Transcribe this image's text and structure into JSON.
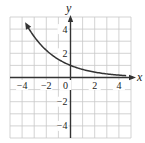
{
  "chart_data": {
    "type": "line",
    "title": "",
    "xlabel": "x",
    "ylabel": "y",
    "xlim": [
      -5,
      5
    ],
    "ylim": [
      -5,
      5
    ],
    "grid": true,
    "x_ticks": [
      -4,
      -2,
      0,
      2,
      4
    ],
    "y_ticks": [
      4,
      2,
      -2,
      -4
    ],
    "x_tick_labels": [
      "−4",
      "−2",
      "0",
      "2",
      "4"
    ],
    "y_tick_labels": [
      "4",
      "2",
      "−2",
      "−4"
    ],
    "series": [
      {
        "name": "curve",
        "description": "decreasing exponential curve, approx y = (2/3)^x, arrows at both ends",
        "x": [
          -3.7,
          -3,
          -2,
          -1,
          0,
          1,
          2,
          3,
          4.8
        ],
        "y": [
          4.48,
          3.38,
          2.25,
          1.5,
          1.0,
          0.67,
          0.44,
          0.3,
          0.14
        ]
      }
    ],
    "legend": null
  },
  "labels": {
    "x_axis": "x",
    "y_axis": "y"
  },
  "colors": {
    "grid": "#c8c8c8",
    "axis": "#333333",
    "curve": "#333333",
    "background": "#ffffff"
  }
}
